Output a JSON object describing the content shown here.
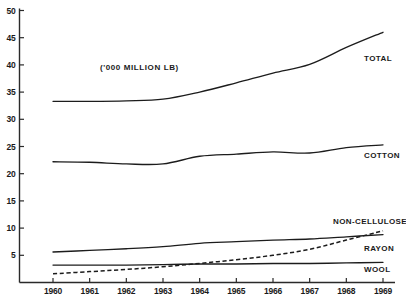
{
  "chart_data": {
    "type": "line",
    "title": "",
    "annotation": "('000 MILLION LB)",
    "xlabel": "",
    "ylabel": "",
    "x": [
      1960,
      1961,
      1962,
      1963,
      1964,
      1965,
      1966,
      1967,
      1968,
      1969
    ],
    "xtick_labels": [
      "1960",
      "1961",
      "1962",
      "1963",
      "1964",
      "1965",
      "1966",
      "1967",
      "1968",
      "1969"
    ],
    "xlim": [
      1960,
      1969
    ],
    "ylim": [
      0,
      50
    ],
    "ytick_labels": [
      "5",
      "10",
      "15",
      "20",
      "25",
      "30",
      "35",
      "40",
      "45",
      "50"
    ],
    "ytick_values": [
      5,
      10,
      15,
      20,
      25,
      30,
      35,
      40,
      45,
      50
    ],
    "grid": false,
    "legend_position": "right-inline",
    "series": [
      {
        "name": "TOTAL",
        "style": "solid",
        "color": "#1c1c1c",
        "values": [
          33.3,
          33.3,
          33.4,
          33.7,
          35.0,
          36.7,
          38.5,
          40.1,
          43.2,
          46.0
        ]
      },
      {
        "name": "COTTON",
        "style": "solid",
        "color": "#1c1c1c",
        "values": [
          22.2,
          22.1,
          21.8,
          21.8,
          23.2,
          23.6,
          24.0,
          23.8,
          24.8,
          25.3
        ]
      },
      {
        "name": "NON-CELLULOSE",
        "style": "dashed",
        "color": "#1c1c1c",
        "values": [
          1.6,
          2.0,
          2.4,
          2.9,
          3.5,
          4.2,
          5.0,
          6.1,
          7.8,
          9.5
        ]
      },
      {
        "name": "RAYON",
        "style": "solid",
        "color": "#1c1c1c",
        "values": [
          5.6,
          5.9,
          6.2,
          6.6,
          7.2,
          7.5,
          7.8,
          8.0,
          8.4,
          8.8
        ]
      },
      {
        "name": "WOOL",
        "style": "solid",
        "color": "#1c1c1c",
        "values": [
          3.2,
          3.2,
          3.2,
          3.3,
          3.4,
          3.4,
          3.5,
          3.5,
          3.6,
          3.7
        ]
      }
    ]
  }
}
